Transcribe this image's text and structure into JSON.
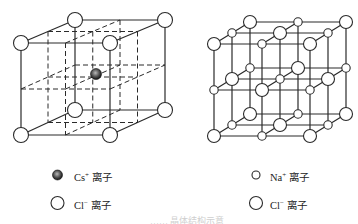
{
  "figure": {
    "left_panel": {
      "name": "CsCl crystal structure",
      "legend": [
        {
          "symbol": "filled-sphere",
          "ion": "Cs",
          "charge": "+",
          "label": "离子"
        },
        {
          "symbol": "open-circle-large",
          "ion": "Cl",
          "charge": "−",
          "label": "离子"
        }
      ]
    },
    "right_panel": {
      "name": "NaCl crystal structure",
      "legend": [
        {
          "symbol": "open-circle-small",
          "ion": "Na",
          "charge": "+",
          "label": "离子"
        },
        {
          "symbol": "open-circle-large",
          "ion": "Cl",
          "charge": "−",
          "label": "离子"
        }
      ]
    },
    "caption": "…… 晶体结构示意"
  },
  "colors": {
    "line": "#2a2a2a",
    "sphere_fill": "#ffffff",
    "cs_ion_dark": "#1a1a1a",
    "cs_ion_light": "#9a9a9a"
  }
}
